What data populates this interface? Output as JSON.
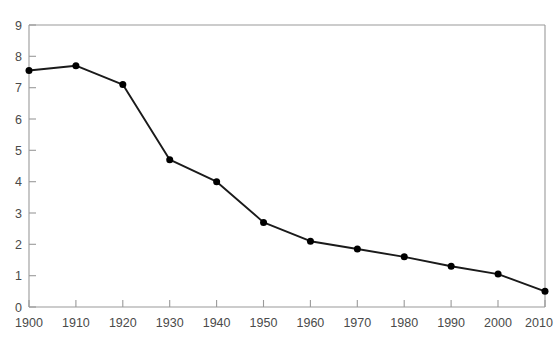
{
  "chart_data": {
    "type": "line",
    "title": "",
    "subtitle": "",
    "xlabel": "",
    "ylabel": "",
    "x": [
      1900,
      1910,
      1920,
      1930,
      1940,
      1950,
      1960,
      1970,
      1980,
      1990,
      2000,
      2010
    ],
    "values": [
      7.55,
      7.7,
      7.1,
      4.7,
      4.0,
      2.7,
      2.1,
      1.85,
      1.6,
      1.3,
      1.05,
      0.5
    ],
    "series": [
      {
        "name": "",
        "values": [
          7.55,
          7.7,
          7.1,
          4.7,
          4.0,
          2.7,
          2.1,
          1.85,
          1.6,
          1.3,
          1.05,
          0.5
        ]
      }
    ],
    "x_tick_labels": [
      "1900",
      "1910",
      "1920",
      "1930",
      "1940",
      "1950",
      "1960",
      "1970",
      "1980",
      "1990",
      "2000",
      "2010"
    ],
    "y_tick_labels": [
      "0",
      "1",
      "2",
      "3",
      "4",
      "5",
      "6",
      "7",
      "8",
      "9"
    ],
    "y_ticks": [
      0,
      1,
      2,
      3,
      4,
      5,
      6,
      7,
      8,
      9
    ],
    "xlim": [
      1900,
      2010
    ],
    "ylim": [
      0,
      9
    ],
    "grid": false,
    "legend": "none",
    "colors": {
      "line": "#1a1a1a",
      "marker": "#000000",
      "axis": "#9a9a9a",
      "tick_text": "#4a4a4a",
      "background": "#ffffff"
    }
  }
}
